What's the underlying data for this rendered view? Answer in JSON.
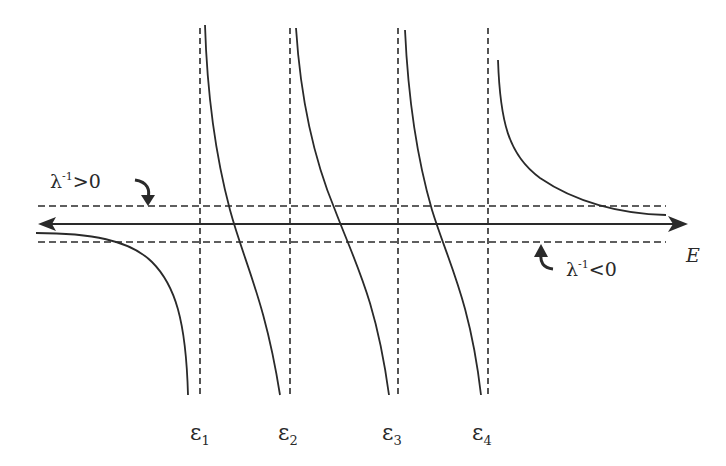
{
  "diagram": {
    "axis": {
      "label": "E",
      "y": 224,
      "x_start": 38,
      "x_end": 686
    },
    "upper_line": {
      "label": "λ⁻¹>0",
      "label_base": "λ",
      "label_sup": "-1",
      "label_rel": ">0",
      "y": 206
    },
    "lower_line": {
      "label": "λ⁻¹<0",
      "label_base": "λ",
      "label_sup": "-1",
      "label_rel": "<0",
      "y": 242
    },
    "poles": [
      {
        "label": "ε1",
        "base": "ε",
        "sub": "1",
        "x": 200
      },
      {
        "label": "ε2",
        "base": "ε",
        "sub": "2",
        "x": 290
      },
      {
        "label": "ε3",
        "base": "ε",
        "sub": "3",
        "x": 398
      },
      {
        "label": "ε4",
        "base": "ε",
        "sub": "4",
        "x": 488
      }
    ],
    "colors": {
      "stroke": "#2a2a2a",
      "background": "#ffffff"
    }
  }
}
